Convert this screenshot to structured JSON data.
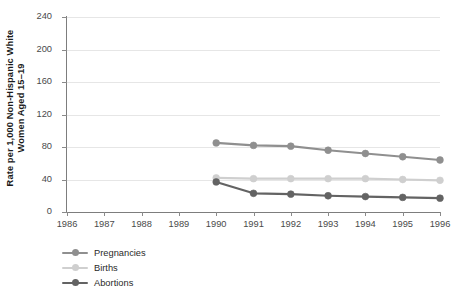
{
  "chart_data": {
    "type": "line",
    "title": "",
    "xlabel": "",
    "ylabel_lines": [
      "Rate per 1,000 Non-Hispanic White",
      "Women Aged 15–19"
    ],
    "x": [
      1986,
      1987,
      1988,
      1989,
      1990,
      1991,
      1992,
      1993,
      1994,
      1995,
      1996
    ],
    "xtick_labels": [
      "1986",
      "1987",
      "1988",
      "1989",
      "1990",
      "1991",
      "1992",
      "1993",
      "1994",
      "1995",
      "1996"
    ],
    "ytick_labels": [
      "0",
      "40",
      "80",
      "120",
      "160",
      "200",
      "240"
    ],
    "yticks": [
      0,
      40,
      80,
      120,
      160,
      200,
      240
    ],
    "ylim": [
      0,
      240
    ],
    "xlim": [
      1986,
      1996
    ],
    "grid": true,
    "legend_position": "bottom-left",
    "series": [
      {
        "name": "Pregnancies",
        "color": "#8f8f8f",
        "x": [
          1990,
          1991,
          1992,
          1993,
          1994,
          1995,
          1996
        ],
        "values": [
          85,
          82,
          81,
          76,
          72,
          68,
          64
        ]
      },
      {
        "name": "Births",
        "color": "#cfcfcf",
        "x": [
          1990,
          1991,
          1992,
          1993,
          1994,
          1995,
          1996
        ],
        "values": [
          42,
          41,
          41,
          41,
          41,
          40,
          39
        ]
      },
      {
        "name": "Abortions",
        "color": "#636363",
        "x": [
          1990,
          1991,
          1992,
          1993,
          1994,
          1995,
          1996
        ],
        "values": [
          37,
          23,
          22,
          20,
          19,
          18,
          17
        ]
      }
    ]
  },
  "legend": {
    "items": [
      {
        "label": "Pregnancies",
        "color": "#8f8f8f"
      },
      {
        "label": "Births",
        "color": "#cfcfcf"
      },
      {
        "label": "Abortions",
        "color": "#636363"
      }
    ]
  },
  "colors": {
    "axis": "#7d7d7d",
    "grid": "#e6e6e6",
    "tick_text": "#4a4a4a",
    "axis_title": "#1b1b1b",
    "background": "#ffffff"
  }
}
